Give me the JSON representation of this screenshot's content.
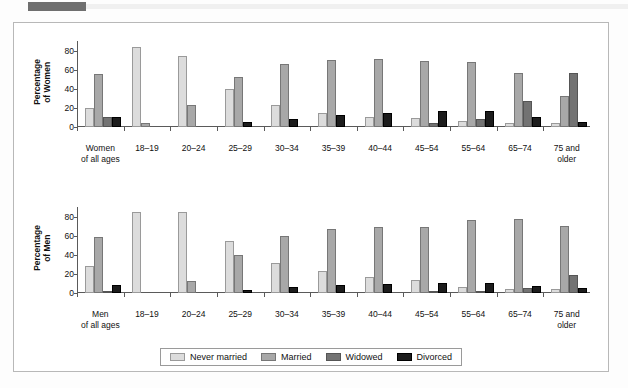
{
  "chart_data": [
    {
      "type": "bar",
      "title": "Percentage of Women",
      "ylabel": "Percentage\nof Women",
      "xlabel": "",
      "ylim": [
        0,
        90
      ],
      "yticks": [
        0,
        20,
        40,
        60,
        80
      ],
      "grid": false,
      "legend_position": "bottom",
      "categories": [
        "Women\nof all ages",
        "18–19",
        "20–24",
        "25–29",
        "30–34",
        "35–39",
        "40–44",
        "45–54",
        "55–64",
        "65–74",
        "75 and\nolder"
      ],
      "series": [
        {
          "name": "Never married",
          "color": "#dcdcdc",
          "values": [
            20,
            84,
            74,
            40,
            23,
            15,
            11,
            9,
            6,
            4,
            4
          ]
        },
        {
          "name": "Married",
          "color": "#a8a8a8",
          "values": [
            56,
            4,
            23,
            52,
            66,
            70,
            71,
            69,
            68,
            57,
            32
          ]
        },
        {
          "name": "Widowed",
          "color": "#737373",
          "values": [
            10,
            0,
            0,
            0,
            0,
            0,
            0,
            4,
            8,
            27,
            57
          ]
        },
        {
          "name": "Divorced",
          "color": "#1c1c1c",
          "values": [
            11,
            0,
            0,
            5,
            8,
            13,
            15,
            17,
            17,
            11,
            5
          ]
        }
      ]
    },
    {
      "type": "bar",
      "title": "Percentage of Men",
      "ylabel": "Percentage\nof Men",
      "xlabel": "",
      "ylim": [
        0,
        90
      ],
      "yticks": [
        0,
        20,
        40,
        60,
        80
      ],
      "grid": false,
      "legend_position": "bottom",
      "categories": [
        "Men\nof all ages",
        "18–19",
        "20–24",
        "25–29",
        "30–34",
        "35–39",
        "40–44",
        "45–54",
        "55–64",
        "65–74",
        "75 and\nolder"
      ],
      "series": [
        {
          "name": "Never married",
          "color": "#dcdcdc",
          "values": [
            28,
            85,
            85,
            54,
            31,
            23,
            17,
            14,
            6,
            4,
            4
          ]
        },
        {
          "name": "Married",
          "color": "#a8a8a8",
          "values": [
            59,
            0,
            13,
            40,
            60,
            67,
            69,
            69,
            76,
            77,
            70
          ]
        },
        {
          "name": "Widowed",
          "color": "#737373",
          "values": [
            2,
            0,
            0,
            0,
            0,
            0,
            0,
            1,
            2,
            5,
            19
          ]
        },
        {
          "name": "Divorced",
          "color": "#1c1c1c",
          "values": [
            8,
            0,
            0,
            3,
            6,
            8,
            9,
            11,
            10,
            7,
            5
          ]
        }
      ]
    }
  ],
  "legend": {
    "items": [
      {
        "label": "Never married",
        "color": "#dcdcdc",
        "key": "never"
      },
      {
        "label": "Married",
        "color": "#a8a8a8",
        "key": "married"
      },
      {
        "label": "Widowed",
        "color": "#737373",
        "key": "widowed"
      },
      {
        "label": "Divorced",
        "color": "#1c1c1c",
        "key": "divorced"
      }
    ]
  }
}
